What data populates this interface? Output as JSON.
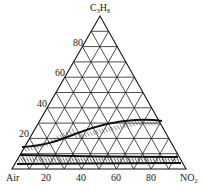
{
  "diagram": {
    "type": "ternary",
    "vertices": {
      "top": {
        "label_main": "C",
        "label_sub1": "3",
        "label_mid": "H",
        "label_sub2": "8"
      },
      "left": {
        "label": "Air"
      },
      "right": {
        "label_main": "NO",
        "label_sub": "2"
      }
    },
    "bottom_ticks": [
      "20",
      "40",
      "60",
      "80"
    ],
    "left_ticks": [
      "80",
      "60",
      "40",
      "20"
    ],
    "grid_step_percent": 10,
    "regions": [
      {
        "name": "upper-boundary-curve",
        "description": "upper flammability limit curve with hatching beneath"
      },
      {
        "name": "lower-boundary-lines",
        "description": "lower flammability limit band with hatching"
      }
    ]
  },
  "chart_data": {
    "type": "ternary",
    "title": "",
    "axes": [
      "C3H8",
      "Air",
      "NO2"
    ],
    "ticks": [
      20,
      40,
      60,
      80
    ],
    "upper_limit_curve_c3h8_pct": [
      {
        "no2": 0,
        "c3h8": 13
      },
      {
        "no2": 20,
        "c3h8": 14
      },
      {
        "no2": 40,
        "c3h8": 20
      },
      {
        "no2": 60,
        "c3h8": 25
      },
      {
        "no2": 75,
        "c3h8": 26
      }
    ],
    "lower_limit_c3h8_pct": [
      {
        "no2": 0,
        "c3h8": 5
      },
      {
        "no2": 50,
        "c3h8": 4
      },
      {
        "no2": 95,
        "c3h8": 3
      }
    ],
    "grid": true
  }
}
